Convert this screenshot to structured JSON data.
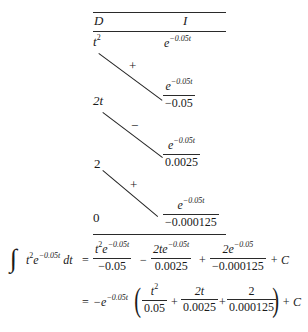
{
  "table": {
    "header": {
      "d": "D",
      "i": "I"
    },
    "rows": [
      {
        "d_base": "t",
        "d_exp": "2",
        "i_base": "e",
        "i_exp": "−0.05t"
      },
      {
        "d": "2t",
        "sign": "+",
        "i_num_base": "e",
        "i_num_exp": "−0.05t",
        "i_den": "−0.05"
      },
      {
        "d": "2",
        "sign": "−",
        "i_num_base": "e",
        "i_num_exp": "−0.05t",
        "i_den": "0.0025"
      },
      {
        "d": "0",
        "sign": "+",
        "i_num_base": "e",
        "i_num_exp": "−0.05t",
        "i_den": "−0.000125"
      }
    ]
  },
  "equation": {
    "lhs": {
      "integral": "∫",
      "t": "t",
      "t_exp": "2",
      "e": "e",
      "e_exp": "−0.05t",
      "dt": "dt"
    },
    "eq1": "=",
    "term1": {
      "num_t": "t",
      "num_t_exp": "2",
      "num_e": "e",
      "num_e_exp": "−0.05t",
      "den": "−0.05"
    },
    "op1": "−",
    "term2": {
      "num": "2te",
      "num_exp": "−0.05t",
      "den": "0.0025"
    },
    "op2": "+",
    "term3": {
      "num": "2e",
      "num_exp": "−0.05",
      "den": "−0.000125"
    },
    "op3": "+ C",
    "eq2": "=",
    "factor": {
      "base": "−e",
      "exp": "−0.05t"
    },
    "lparen": "(",
    "f1": {
      "num": "t",
      "num_exp": "2",
      "den": "0.05"
    },
    "fop1": "+",
    "f2": {
      "num": "2t",
      "den": "0.0025"
    },
    "fop2": "+",
    "f3": {
      "num": "2",
      "den": "0.000125"
    },
    "rparen": ")",
    "tail": "+ C"
  }
}
